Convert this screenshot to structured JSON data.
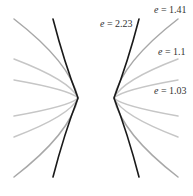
{
  "figure": {
    "width": 193,
    "height": 196,
    "center": [
      96,
      98
    ],
    "colors": {
      "highlight": "#1a1a1a",
      "medium": "#a8a8a8",
      "light": "#c6c6c6",
      "label": "#333333"
    },
    "curves": [
      {
        "e": "2.23",
        "color": "#1a1a1a",
        "width": 1.6,
        "left_top": [
          53,
          19
        ],
        "right_top": [
          139,
          19
        ],
        "vertex_left": [
          78,
          98
        ],
        "vertex_right": [
          114,
          98
        ]
      },
      {
        "e": "1.41",
        "color": "#a8a8a8",
        "width": 1.5,
        "left_top": [
          14,
          19
        ],
        "right_top": [
          178,
          19
        ],
        "vertex_left": [
          78,
          98
        ],
        "vertex_right": [
          114,
          98
        ]
      },
      {
        "e": "1.1",
        "color": "#c6c6c6",
        "width": 1.5,
        "left_top": [
          14,
          59
        ],
        "right_top": [
          178,
          59
        ],
        "vertex_left": [
          78,
          98
        ],
        "vertex_right": [
          114,
          98
        ]
      },
      {
        "e": "1.03",
        "color": "#c6c6c6",
        "width": 1.5,
        "left_top": [
          14,
          80
        ],
        "right_top": [
          178,
          80
        ],
        "vertex_left": [
          78,
          98
        ],
        "vertex_right": [
          114,
          98
        ]
      }
    ],
    "labels": [
      {
        "var": "e",
        "text": " = 2.23",
        "x": 100,
        "y": 19
      },
      {
        "var": "e",
        "text": " = 1.41",
        "x": 154,
        "y": 5
      },
      {
        "var": "e",
        "text": " = 1.1",
        "x": 158,
        "y": 47
      },
      {
        "var": "e",
        "text": " = 1.03",
        "x": 154,
        "y": 86
      }
    ]
  }
}
